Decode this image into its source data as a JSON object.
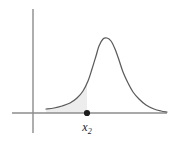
{
  "figure": {
    "background_color": "#ffffff",
    "curve_color": "#5b5b5b",
    "axis_color": "#8c8c8c",
    "shade_color": "#ededed",
    "marker_color": "#1d1d1d",
    "point_label_base": "x",
    "point_label_subscript": "2",
    "point_label_full": "x₂"
  },
  "chart_data": {
    "type": "line",
    "title": "",
    "subtitle": "",
    "xlabel": "",
    "ylabel": "",
    "grid": false,
    "legend": null,
    "axes": {
      "x_axis": {
        "visible": true,
        "pixel_start_x": 12,
        "pixel_end_x": 167,
        "pixel_y": 113,
        "ticks": [],
        "tick_labels": []
      },
      "y_axis": {
        "visible": true,
        "pixel_x": 33,
        "pixel_top_y": 9,
        "pixel_bottom_y": 133,
        "ticks": [],
        "tick_labels": []
      }
    },
    "series": [
      {
        "name": "density curve",
        "kind": "bell-shaped density",
        "peak_x_px": 103,
        "peak_y_px": 38,
        "baseline_y_px": 113,
        "left_end_x_px": 46,
        "left_end_y_px": 109,
        "right_end_x_px": 167,
        "right_end_y_px": 112,
        "points_px": [
          [
            46,
            109
          ],
          [
            54,
            108
          ],
          [
            62,
            106
          ],
          [
            70,
            103
          ],
          [
            77,
            98
          ],
          [
            83,
            91
          ],
          [
            88,
            81
          ],
          [
            92,
            69
          ],
          [
            96,
            56
          ],
          [
            99,
            46
          ],
          [
            103,
            39
          ],
          [
            107,
            38
          ],
          [
            111,
            41
          ],
          [
            115,
            49
          ],
          [
            119,
            60
          ],
          [
            123,
            72
          ],
          [
            128,
            83
          ],
          [
            133,
            92
          ],
          [
            139,
            99
          ],
          [
            146,
            105
          ],
          [
            154,
            109
          ],
          [
            161,
            111
          ],
          [
            167,
            112
          ]
        ]
      }
    ],
    "annotations": [
      {
        "kind": "point-marker",
        "label": "x₂",
        "label_base": "x",
        "label_subscript": "2",
        "x_px": 87,
        "y_px": 113,
        "dot_radius_px": 3.1,
        "label_x_px": 87,
        "label_y_px": 131
      },
      {
        "kind": "shaded-region",
        "description": "left tail area under curve up to x₂",
        "from_x_px": 46,
        "to_x_px": 87,
        "fill": "#ededed"
      }
    ]
  }
}
